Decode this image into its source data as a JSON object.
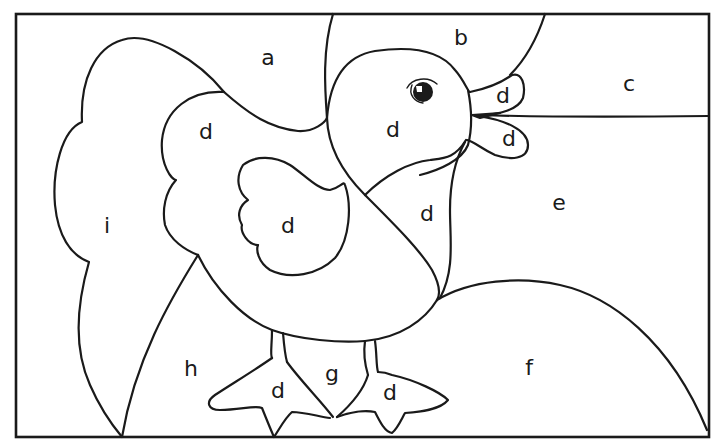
{
  "page": {
    "ink_color": "#1a1a1a",
    "paper_color": "#ffffff"
  },
  "regions": [
    {
      "id": "a",
      "label": "a",
      "area": "sky-upper-left",
      "x": 268,
      "y": 58
    },
    {
      "id": "b",
      "label": "b",
      "area": "sky-top-center",
      "x": 461,
      "y": 38
    },
    {
      "id": "c",
      "label": "c",
      "area": "sky-upper-right",
      "x": 629,
      "y": 84
    },
    {
      "id": "d-wing-back",
      "label": "d",
      "area": "back-wing",
      "x": 206,
      "y": 132
    },
    {
      "id": "d-head",
      "label": "d",
      "area": "head",
      "x": 393,
      "y": 130
    },
    {
      "id": "d-beak-top",
      "label": "d",
      "area": "beak-upper",
      "x": 503,
      "y": 96
    },
    {
      "id": "d-beak-bottom",
      "label": "d",
      "area": "beak-lower",
      "x": 509,
      "y": 139
    },
    {
      "id": "d-wing",
      "label": "d",
      "area": "wing",
      "x": 288,
      "y": 226
    },
    {
      "id": "d-chest",
      "label": "d",
      "area": "chest",
      "x": 427,
      "y": 214
    },
    {
      "id": "e",
      "label": "e",
      "area": "background-right",
      "x": 559,
      "y": 203
    },
    {
      "id": "f",
      "label": "f",
      "area": "hill",
      "x": 529,
      "y": 368
    },
    {
      "id": "g",
      "label": "g",
      "area": "ground-between-feet",
      "x": 332,
      "y": 374
    },
    {
      "id": "h",
      "label": "h",
      "area": "ground-left",
      "x": 191,
      "y": 369
    },
    {
      "id": "i",
      "label": "i",
      "area": "bush-left",
      "x": 107,
      "y": 226
    },
    {
      "id": "d-foot-left",
      "label": "d",
      "area": "left-foot",
      "x": 278,
      "y": 391
    },
    {
      "id": "d-foot-right",
      "label": "d",
      "area": "right-foot",
      "x": 390,
      "y": 393
    }
  ]
}
